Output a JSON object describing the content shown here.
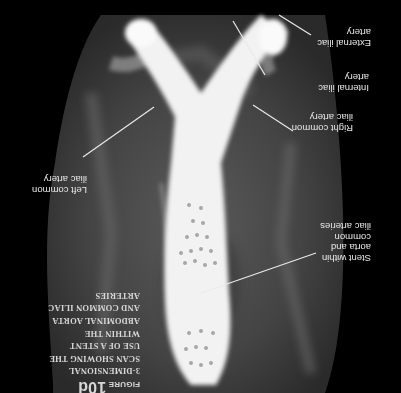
{
  "figure": {
    "orientation": "rotated-180",
    "caption": {
      "figure_label": "FIGURE",
      "figure_number": "10d",
      "lines": [
        "3-DIMENSIONAL",
        "SCAN SHOWING THE",
        "USE OF A STENT",
        "WITHIN THE",
        "ABDOMINAL AORTA",
        "AND COMMON ILIAC",
        "ARTERIES"
      ]
    },
    "labels": {
      "external_iliac": [
        "External iliac",
        "artery"
      ],
      "internal_iliac": [
        "Internal iliac",
        "artery"
      ],
      "right_common_iliac": [
        "Right common",
        "iliac artery"
      ],
      "left_common_iliac": [
        "Left common",
        "iliac artery"
      ],
      "stent": [
        "Stent within",
        "aorta and common",
        "iliac arteries"
      ]
    },
    "colors": {
      "background": "#000000",
      "scan_tissue": "#4a4a4a",
      "stent": "#f4f4f4",
      "text": "#e8e8e8"
    }
  }
}
